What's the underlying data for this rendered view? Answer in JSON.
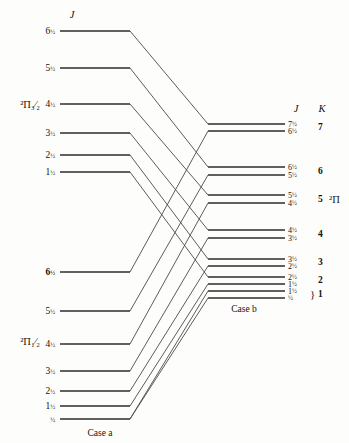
{
  "figure": {
    "width": 349,
    "height": 443,
    "background": "#fdfdfc",
    "line_color": "#2b2b2b",
    "connector_color": "#4a4a4a"
  },
  "headers": {
    "left_J": "J",
    "right_J": "J",
    "right_K": "K"
  },
  "case_labels": {
    "left": "Case a",
    "right": "Case b"
  },
  "terms": {
    "upper_left": {
      "sup": "2",
      "symbol": "Π",
      "sub": "3/2",
      "display": "²Π₃⁄₂"
    },
    "lower_left": {
      "sup": "2",
      "symbol": "Π",
      "sub": "1/2",
      "display": "²Π₁⁄₂"
    },
    "right": {
      "sup": "2",
      "symbol": "Π",
      "sub": "",
      "display": "²Π"
    }
  },
  "chart_data": {
    "type": "diagram",
    "left_column": {
      "label": "Case a",
      "header": "J",
      "groups": [
        {
          "term": "²Π₃⁄₂",
          "term_x": 40,
          "term_y": 108,
          "levels": [
            {
              "J": "6½",
              "j_num": "6",
              "j_frac": "½",
              "y": 31,
              "x1": 60,
              "x2": 130,
              "bold": false
            },
            {
              "J": "5½",
              "j_num": "5",
              "j_frac": "½",
              "y": 68,
              "x1": 60,
              "x2": 130,
              "bold": false
            },
            {
              "J": "4½",
              "j_num": "4",
              "j_frac": "½",
              "y": 104,
              "x1": 60,
              "x2": 130,
              "bold": false
            },
            {
              "J": "3½",
              "j_num": "3",
              "j_frac": "½",
              "y": 133,
              "x1": 60,
              "x2": 130,
              "bold": false
            },
            {
              "J": "2½",
              "j_num": "2",
              "j_frac": "½",
              "y": 155,
              "x1": 60,
              "x2": 130,
              "bold": false
            },
            {
              "J": "1½",
              "j_num": "1",
              "j_frac": "½",
              "y": 172,
              "x1": 60,
              "x2": 130,
              "bold": false
            }
          ]
        },
        {
          "term": "²Π₁⁄₂",
          "term_x": 40,
          "term_y": 345,
          "levels": [
            {
              "J": "6½",
              "j_num": "6",
              "j_frac": "½",
              "y": 272,
              "x1": 60,
              "x2": 130,
              "bold": true
            },
            {
              "J": "5½",
              "j_num": "5",
              "j_frac": "½",
              "y": 311,
              "x1": 60,
              "x2": 130,
              "bold": false
            },
            {
              "J": "4½",
              "j_num": "4",
              "j_frac": "½",
              "y": 344,
              "x1": 60,
              "x2": 130,
              "bold": false
            },
            {
              "J": "3½",
              "j_num": "3",
              "j_frac": "½",
              "y": 371,
              "x1": 60,
              "x2": 130,
              "bold": false
            },
            {
              "J": "2½",
              "j_num": "2",
              "j_frac": "½",
              "y": 391,
              "x1": 60,
              "x2": 130,
              "bold": false
            },
            {
              "J": "1½",
              "j_num": "1",
              "j_frac": "½",
              "y": 406,
              "x1": 60,
              "x2": 130,
              "bold": false
            },
            {
              "J": "½",
              "j_num": "",
              "j_frac": "½",
              "y": 419,
              "x1": 60,
              "x2": 130,
              "bold": false
            }
          ]
        }
      ]
    },
    "right_column": {
      "label": "Case b",
      "headers": {
        "J": "J",
        "K": "K"
      },
      "term_label": "²Π",
      "term_label_K": "5",
      "groups": [
        {
          "K": "7",
          "y_center": 127,
          "levels": [
            {
              "J": "7½",
              "j_num": "7",
              "j_frac": "½",
              "y": 124,
              "x1": 208,
              "x2": 285
            },
            {
              "J": "6½",
              "j_num": "6",
              "j_frac": "½",
              "y": 131,
              "x1": 208,
              "x2": 285
            }
          ]
        },
        {
          "K": "6",
          "y_center": 171,
          "levels": [
            {
              "J": "6½",
              "j_num": "6",
              "j_frac": "½",
              "y": 167,
              "x1": 208,
              "x2": 285
            },
            {
              "J": "5½",
              "j_num": "5",
              "j_frac": "½",
              "y": 175,
              "x1": 208,
              "x2": 285
            }
          ]
        },
        {
          "K": "5",
          "y_center": 199,
          "levels": [
            {
              "J": "5½",
              "j_num": "5",
              "j_frac": "½",
              "y": 195,
              "x1": 208,
              "x2": 285
            },
            {
              "J": "4½",
              "j_num": "4",
              "j_frac": "½",
              "y": 203,
              "x1": 208,
              "x2": 285
            }
          ]
        },
        {
          "K": "4",
          "y_center": 234,
          "levels": [
            {
              "J": "4½",
              "j_num": "4",
              "j_frac": "½",
              "y": 230,
              "x1": 208,
              "x2": 285
            },
            {
              "J": "3½",
              "j_num": "3",
              "j_frac": "½",
              "y": 238,
              "x1": 208,
              "x2": 285
            }
          ]
        },
        {
          "K": "3",
          "y_center": 262,
          "levels": [
            {
              "J": "3½",
              "j_num": "3",
              "j_frac": "½",
              "y": 259,
              "x1": 208,
              "x2": 285
            },
            {
              "J": "2½",
              "j_num": "2",
              "j_frac": "½",
              "y": 266,
              "x1": 208,
              "x2": 285
            }
          ]
        },
        {
          "K": "2",
          "y_center": 280,
          "levels": [
            {
              "J": "2½",
              "j_num": "2",
              "j_frac": "½",
              "y": 277,
              "x1": 208,
              "x2": 285
            },
            {
              "J": "1½",
              "j_num": "1",
              "j_frac": "½",
              "y": 284,
              "x1": 208,
              "x2": 285
            }
          ]
        },
        {
          "K": "1",
          "y_center": 294,
          "brace": "}",
          "levels": [
            {
              "J": "1½",
              "j_num": "1",
              "j_frac": "½",
              "y": 291,
              "x1": 208,
              "x2": 285
            },
            {
              "J": "½",
              "j_num": "",
              "j_frac": "½",
              "y": 298,
              "x1": 208,
              "x2": 285
            }
          ]
        }
      ]
    },
    "connectors": [
      {
        "from_y": 31,
        "to_y": 124,
        "x1": 130,
        "x2": 208,
        "from": "a-3/2-J6.5",
        "to": "b-K7-J7.5"
      },
      {
        "from_y": 68,
        "to_y": 167,
        "x1": 130,
        "x2": 208,
        "from": "a-3/2-J5.5",
        "to": "b-K6-J6.5"
      },
      {
        "from_y": 104,
        "to_y": 195,
        "x1": 130,
        "x2": 208,
        "from": "a-3/2-J4.5",
        "to": "b-K5-J5.5"
      },
      {
        "from_y": 133,
        "to_y": 230,
        "x1": 130,
        "x2": 208,
        "from": "a-3/2-J3.5",
        "to": "b-K4-J4.5"
      },
      {
        "from_y": 155,
        "to_y": 259,
        "x1": 130,
        "x2": 208,
        "from": "a-3/2-J2.5",
        "to": "b-K3-J3.5"
      },
      {
        "from_y": 172,
        "to_y": 277,
        "x1": 130,
        "x2": 208,
        "from": "a-3/2-J1.5",
        "to": "b-K2-J2.5"
      },
      {
        "from_y": 272,
        "to_y": 131,
        "x1": 130,
        "x2": 208,
        "from": "a-1/2-J6.5",
        "to": "b-K7-J6.5"
      },
      {
        "from_y": 311,
        "to_y": 175,
        "x1": 130,
        "x2": 208,
        "from": "a-1/2-J5.5",
        "to": "b-K6-J5.5"
      },
      {
        "from_y": 344,
        "to_y": 203,
        "x1": 130,
        "x2": 208,
        "from": "a-1/2-J4.5",
        "to": "b-K5-J4.5"
      },
      {
        "from_y": 371,
        "to_y": 238,
        "x1": 130,
        "x2": 208,
        "from": "a-1/2-J3.5",
        "to": "b-K4-J3.5"
      },
      {
        "from_y": 391,
        "to_y": 266,
        "x1": 130,
        "x2": 208,
        "from": "a-1/2-J2.5",
        "to": "b-K3-J2.5"
      },
      {
        "from_y": 406,
        "to_y": 284,
        "x1": 130,
        "x2": 208,
        "from": "a-1/2-J1.5",
        "to": "b-K2-J1.5"
      },
      {
        "from_y": 419,
        "to_y": 291,
        "x1": 130,
        "x2": 208,
        "from": "a-1/2-J0.5",
        "to": "b-K1-J1.5"
      },
      {
        "from_y": 419,
        "to_y": 298,
        "x1": 130,
        "x2": 208,
        "from": "a-1/2-J0.5b",
        "to": "b-K1-J0.5"
      }
    ]
  }
}
